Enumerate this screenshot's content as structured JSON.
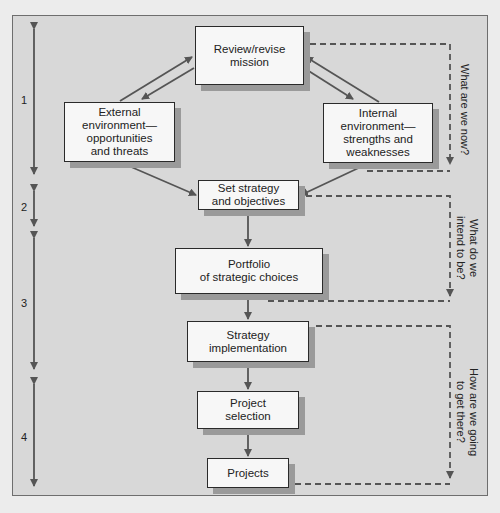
{
  "diagram": {
    "nodes": [
      {
        "id": "review",
        "label": "Review/revise\nmission"
      },
      {
        "id": "external",
        "label": "External\nenvironment—\nopportunities\nand threats"
      },
      {
        "id": "internal",
        "label": "Internal\nenvironment—\nstrengths and\nweaknesses"
      },
      {
        "id": "strategy",
        "label": "Set strategy\nand objectives"
      },
      {
        "id": "portfolio",
        "label": "Portfolio\nof strategic choices"
      },
      {
        "id": "implementation",
        "label": "Strategy\nimplementation"
      },
      {
        "id": "selection",
        "label": "Project\nselection"
      },
      {
        "id": "projects",
        "label": "Projects"
      }
    ],
    "stages": [
      {
        "label": "1"
      },
      {
        "label": "2"
      },
      {
        "label": "3"
      },
      {
        "label": "4"
      }
    ],
    "questions": [
      {
        "label": "What are we now?"
      },
      {
        "label": "What do we\nintend to be?"
      },
      {
        "label": "How are we going\nto get there?"
      }
    ],
    "edges": [
      {
        "from": "external",
        "to": "review"
      },
      {
        "from": "review",
        "to": "external"
      },
      {
        "from": "internal",
        "to": "review"
      },
      {
        "from": "review",
        "to": "internal"
      },
      {
        "from": "external",
        "to": "strategy"
      },
      {
        "from": "internal",
        "to": "strategy"
      },
      {
        "from": "strategy",
        "to": "portfolio"
      },
      {
        "from": "portfolio",
        "to": "implementation"
      },
      {
        "from": "implementation",
        "to": "selection"
      },
      {
        "from": "selection",
        "to": "projects"
      }
    ],
    "colors": {
      "panel": "#d8d8d8",
      "box": "#f7f7f7",
      "line": "#555555",
      "shadow": "#9a9a9a"
    }
  }
}
